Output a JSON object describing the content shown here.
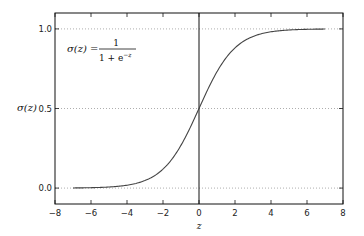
{
  "chart_data": {
    "type": "line",
    "title": "",
    "xlabel": "z",
    "ylabel": "σ(z)",
    "xlim": [
      -8,
      8
    ],
    "ylim": [
      -0.1,
      1.1
    ],
    "grid": "horizontal dotted at y = 0.0, 0.5, 1.0",
    "x_ticks": [
      -8,
      -6,
      -4,
      -2,
      0,
      2,
      4,
      6,
      8
    ],
    "x_tick_labels": [
      "−8",
      "−6",
      "−4",
      "−2",
      "0",
      "2",
      "4",
      "6",
      "8"
    ],
    "y_ticks": [
      0.0,
      0.5,
      1.0
    ],
    "y_tick_labels": [
      "0.0",
      "0.5",
      "1.0"
    ],
    "vertical_line": 0,
    "annotation": "σ(z) = 1 / (1 + e^−z)",
    "series": [
      {
        "name": "sigmoid",
        "function": "1/(1+exp(-z))",
        "x": [
          -7,
          -6,
          -5,
          -4,
          -3,
          -2,
          -1,
          0,
          1,
          2,
          3,
          4,
          5,
          6,
          7
        ],
        "values": [
          0.0009,
          0.0025,
          0.0067,
          0.018,
          0.047,
          0.119,
          0.269,
          0.5,
          0.731,
          0.881,
          0.953,
          0.982,
          0.993,
          0.9975,
          0.9991
        ],
        "color": "#444444"
      }
    ]
  },
  "labels": {
    "ylabel_sigma": "σ",
    "ylabel_rest": "(z)",
    "xlabel": "z",
    "formula_lhs": "σ(z) =",
    "formula_num": "1",
    "formula_den": "1 + e",
    "formula_exp": "−z"
  }
}
